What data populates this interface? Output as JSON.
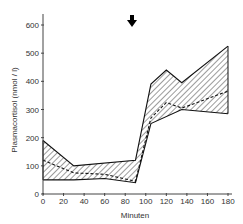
{
  "chart_data": {
    "type": "area",
    "title": "",
    "xlabel": "Minuten",
    "ylabel": "Plasmacortisol (nmol / l)",
    "xlim": [
      0,
      180
    ],
    "ylim": [
      0,
      600
    ],
    "xticks": [
      0,
      20,
      40,
      60,
      80,
      100,
      120,
      140,
      160,
      180
    ],
    "yticks": [
      0,
      100,
      200,
      300,
      400,
      500,
      600
    ],
    "grid": false,
    "legend": null,
    "annotations": [
      {
        "type": "arrow-down",
        "x": 90,
        "description": "stimulus marker"
      }
    ],
    "series": [
      {
        "name": "upper bound",
        "style": "solid",
        "x": [
          0,
          30,
          90,
          105,
          120,
          135,
          180
        ],
        "values": [
          190,
          100,
          120,
          390,
          440,
          395,
          525
        ]
      },
      {
        "name": "mean",
        "style": "dashed",
        "x": [
          0,
          30,
          60,
          90,
          105,
          120,
          135,
          180
        ],
        "values": [
          120,
          75,
          70,
          45,
          270,
          325,
          305,
          365
        ]
      },
      {
        "name": "lower bound",
        "style": "solid",
        "x": [
          0,
          30,
          60,
          90,
          105,
          135,
          180
        ],
        "values": [
          50,
          50,
          55,
          40,
          250,
          300,
          285
        ]
      }
    ],
    "fill": "hatched band between upper and lower bound"
  },
  "labels": {
    "xlabel": "Minuten",
    "ylabel": "Plasmacortisol (nmol / l)",
    "xticks": [
      "0",
      "20",
      "40",
      "60",
      "80",
      "100",
      "120",
      "140",
      "160",
      "180"
    ],
    "yticks": [
      "0",
      "100",
      "200",
      "300",
      "400",
      "500",
      "600"
    ]
  }
}
